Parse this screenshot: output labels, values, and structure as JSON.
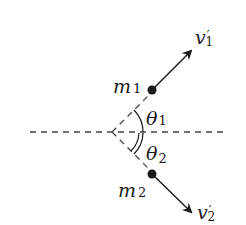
{
  "diagram": {
    "colors": {
      "stroke": "#1a1a1a",
      "dash": "#444444",
      "background": "#ffffff"
    },
    "reference_line": {
      "style": "dashed",
      "orientation": "horizontal"
    },
    "masses": [
      {
        "id": "m1",
        "symbol": "m",
        "subscript": "1",
        "velocity": {
          "symbol": "v",
          "subscript": "1",
          "prime": "′"
        },
        "angle": {
          "symbol": "θ",
          "subscript": "1"
        }
      },
      {
        "id": "m2",
        "symbol": "m",
        "subscript": "2",
        "velocity": {
          "symbol": "v",
          "subscript": "2",
          "prime": "′"
        },
        "angle": {
          "symbol": "θ",
          "subscript": "2"
        }
      }
    ]
  }
}
